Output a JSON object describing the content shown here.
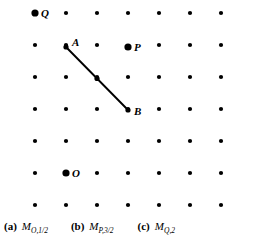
{
  "figure": {
    "width": 256,
    "height": 247,
    "background_color": "#ffffff",
    "ink_color": "#000000"
  },
  "lattice": {
    "columns": 7,
    "rows": 7,
    "x_start": 35,
    "y_start": 13,
    "x_spacing": 31,
    "y_spacing": 32,
    "normal_dot_radius": 2.1,
    "emphasized_dot_radius": 3.6
  },
  "emphasized_points": [
    {
      "name": "Q",
      "label": "Q",
      "col": 0,
      "row": 0,
      "x": 35,
      "y": 13,
      "label_dx": 6,
      "label_dy": -5
    },
    {
      "name": "P",
      "label": "P",
      "col": 3,
      "row": 1,
      "x": 128,
      "y": 47,
      "label_dx": 6,
      "label_dy": -5
    },
    {
      "name": "O",
      "label": "O",
      "col": 1,
      "row": 5,
      "x": 66,
      "y": 173,
      "label_dx": 6,
      "label_dy": -5
    }
  ],
  "segment": {
    "name": "AB",
    "start": {
      "label": "A",
      "col": 1,
      "row": 1,
      "x": 66,
      "y": 47,
      "label_dx": 6,
      "label_dy": -10
    },
    "end": {
      "label": "B",
      "col": 3,
      "row": 3,
      "x": 128,
      "y": 110,
      "label_dx": 6,
      "label_dy": -4
    },
    "midpoint": {
      "x": 97,
      "y": 78.5,
      "radius": 2.6
    },
    "stroke_width": 1.9,
    "color": "#000000"
  },
  "labels": {
    "A": "A",
    "B": "B",
    "O": "O",
    "P": "P",
    "Q": "Q"
  },
  "captions": [
    {
      "tag": "(a)",
      "symbol": "M",
      "subscript": "O,1/2",
      "full": "(a) M_O,1/2"
    },
    {
      "tag": "(b)",
      "symbol": "M",
      "subscript": "P,3/2",
      "full": "(b) M_P,3/2"
    },
    {
      "tag": "(c)",
      "symbol": "M",
      "subscript": "Q,2",
      "full": "(c) M_Q,2"
    }
  ]
}
